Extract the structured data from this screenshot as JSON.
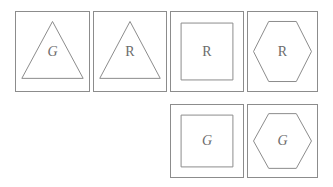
{
  "canvas": {
    "width": 333,
    "height": 187,
    "background": "#ffffff",
    "stroke_color": "#8c8c8c",
    "letter_color": "#6b6b6b"
  },
  "legend": {
    "shape_names": [
      "triangle",
      "square",
      "hexagon"
    ],
    "letter_names": [
      "G",
      "R"
    ]
  },
  "grid": {
    "rows": [
      {
        "row_index": 1,
        "cards": [
          {
            "id": "card-1",
            "shape": "triangle",
            "letter": "G",
            "column": 1,
            "x": 15,
            "y": 11,
            "width": 75,
            "height": 81
          },
          {
            "id": "card-2",
            "shape": "triangle",
            "letter": "R",
            "column": 2,
            "x": 93,
            "y": 11,
            "width": 74,
            "height": 81
          },
          {
            "id": "card-3",
            "shape": "square",
            "letter": "R",
            "column": 3,
            "x": 170,
            "y": 11,
            "width": 74,
            "height": 81
          },
          {
            "id": "card-4",
            "shape": "hexagon",
            "letter": "R",
            "column": 4,
            "x": 247,
            "y": 11,
            "width": 71,
            "height": 81
          }
        ]
      },
      {
        "row_index": 2,
        "cards": [
          {
            "id": "card-5",
            "shape": "square",
            "letter": "G",
            "column": 3,
            "x": 170,
            "y": 104,
            "width": 74,
            "height": 74
          },
          {
            "id": "card-6",
            "shape": "hexagon",
            "letter": "G",
            "column": 4,
            "x": 247,
            "y": 104,
            "width": 71,
            "height": 74
          }
        ]
      }
    ]
  }
}
